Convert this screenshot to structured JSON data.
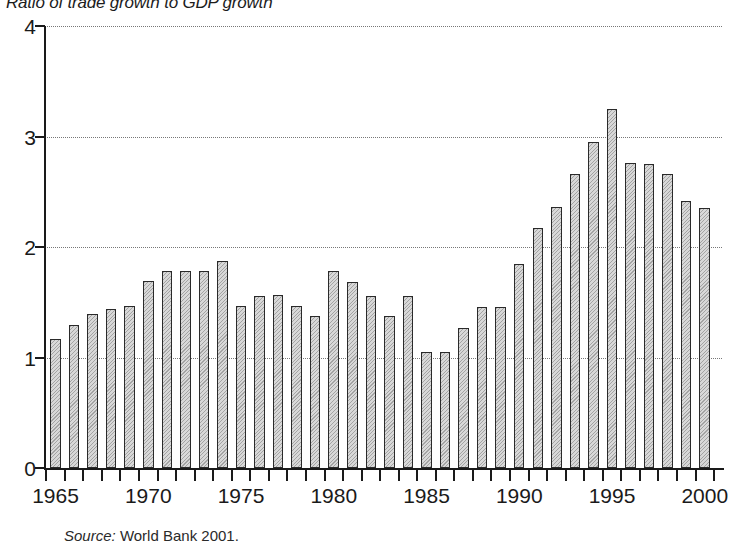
{
  "chart_data": {
    "type": "bar",
    "title": "Ratio of trade growth to GDP growth",
    "xlabel": "",
    "ylabel": "",
    "ylim": [
      0,
      4
    ],
    "y_ticks": [
      "0",
      "1",
      "2",
      "3",
      "4"
    ],
    "y_tick_values": [
      0,
      1,
      2,
      3,
      4
    ],
    "grid": "horizontal dotted gridlines at 1, 2, 3, 4",
    "legend": "none",
    "x_tick_labels": [
      "1965",
      "1970",
      "1975",
      "1980",
      "1985",
      "1990",
      "1995",
      "2000"
    ],
    "x_tick_label_years": [
      1965,
      1970,
      1975,
      1980,
      1985,
      1990,
      1995,
      2000
    ],
    "categories": [
      "1965",
      "1966",
      "1967",
      "1968",
      "1969",
      "1970",
      "1971",
      "1972",
      "1973",
      "1974",
      "1975",
      "1976",
      "1977",
      "1978",
      "1979",
      "1980",
      "1981",
      "1982",
      "1983",
      "1984",
      "1985",
      "1986",
      "1987",
      "1988",
      "1989",
      "1990",
      "1991",
      "1992",
      "1993",
      "1994",
      "1995",
      "1996",
      "1997",
      "1998",
      "1999",
      "2000"
    ],
    "values": [
      1.17,
      1.29,
      1.39,
      1.44,
      1.47,
      1.69,
      1.78,
      1.78,
      1.78,
      1.87,
      1.47,
      1.56,
      1.57,
      1.47,
      1.38,
      1.78,
      1.68,
      1.56,
      1.38,
      1.56,
      1.05,
      1.05,
      1.27,
      1.46,
      1.46,
      1.85,
      2.17,
      2.36,
      2.66,
      2.95,
      3.25,
      2.76,
      2.75,
      2.66,
      2.42,
      2.35
    ],
    "bar_fill": "#d8d8d8",
    "bar_edge": "#2a2a2a",
    "axis_color": "#1a1a1a",
    "gridline_color": "#777777"
  },
  "source": {
    "label": "Source:",
    "text": "World Bank 2001."
  }
}
